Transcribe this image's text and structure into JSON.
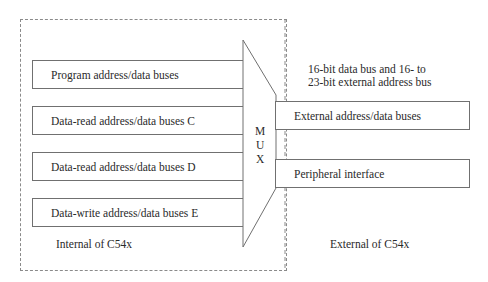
{
  "diagram": {
    "internal_buses": [
      {
        "label": "Program address/data buses"
      },
      {
        "label": "Data-read address/data buses C"
      },
      {
        "label": "Data-read address/data buses D"
      },
      {
        "label": "Data-write address/data buses E"
      }
    ],
    "mux": {
      "letters": [
        "M",
        "U",
        "X"
      ]
    },
    "external_buses": [
      {
        "label": "External address/data buses"
      },
      {
        "label": "Peripheral interface"
      }
    ],
    "annotation": {
      "line1": "16-bit data bus and 16- to",
      "line2": "23-bit external address bus"
    },
    "internal_label": "Internal of C54x",
    "external_label": "External of C54x",
    "colors": {
      "line": "#707070",
      "dashed": "#8a8a8a",
      "text": "#2a2a2a"
    }
  }
}
